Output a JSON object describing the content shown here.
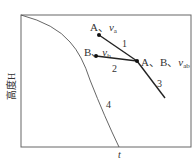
{
  "diagram": {
    "y_axis_label": "高度H",
    "x_axis_label": "t",
    "points": {
      "A": {
        "label": "A、",
        "var": "v",
        "sub": "a"
      },
      "B": {
        "label": "B、",
        "var": "v",
        "sub": "b"
      },
      "AB": {
        "label": "A、B、",
        "var": "v",
        "sub": "ab"
      }
    },
    "line_labels": [
      "1",
      "2",
      "3",
      "4"
    ]
  }
}
